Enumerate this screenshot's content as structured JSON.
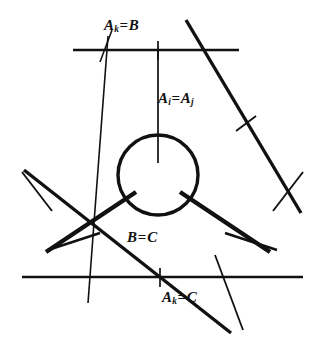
{
  "figure": {
    "name": "reflection-wall-diagram",
    "background_color": "#ffffff",
    "ink_color": "#111111",
    "width": 326,
    "height": 341,
    "labels": {
      "top_wall": {
        "base": "A",
        "sub": "k",
        "relation": "=",
        "rhs": "B",
        "text": "Aₖ=B"
      },
      "vertical_ray": {
        "base": "A",
        "sub": "i",
        "relation": "=",
        "rhs": "A",
        "rhs_sub": "j",
        "text": "Aᵢ=Aⱼ"
      },
      "center_lower": {
        "lhs": "B",
        "relation": "=",
        "rhs": "C",
        "text": "B=C"
      },
      "bottom_wall": {
        "base": "A",
        "sub": "k",
        "relation": "=",
        "rhs": "C",
        "text": "Aₖ=C"
      }
    },
    "geometry": {
      "circle": {
        "cx": 158,
        "cy": 175,
        "r": 42,
        "stroke_width": 3.2
      },
      "radial_rays": [
        {
          "name": "vertical-ray",
          "x1": 158,
          "y1": 52,
          "x2": 158,
          "y2": 162,
          "stroke_width": 1.6
        },
        {
          "name": "lower-left-ray",
          "x1": 48,
          "y1": 253,
          "x2": 133,
          "y2": 196,
          "stroke_width": 4.2
        },
        {
          "name": "lower-right-ray",
          "x1": 268,
          "y1": 253,
          "x2": 183,
          "y2": 196,
          "stroke_width": 4.2
        }
      ],
      "walls": [
        {
          "name": "top-wall",
          "x1": 73,
          "y1": 50,
          "x2": 239,
          "y2": 50,
          "stroke_width": 2.6
        },
        {
          "name": "bottom-wall",
          "x1": 22,
          "y1": 277,
          "x2": 303,
          "y2": 277,
          "stroke_width": 2.6
        },
        {
          "name": "upper-left-thin-diagonal",
          "x1": 107,
          "y1": 37,
          "x2": 90,
          "y2": 302,
          "stroke_width": 1.5
        },
        {
          "name": "upper-right-thick-diagonal",
          "x1": 186,
          "y1": 20,
          "x2": 300,
          "y2": 212,
          "stroke_width": 3.4
        },
        {
          "name": "left-thick-diagonal",
          "x1": 24,
          "y1": 170,
          "x2": 228,
          "y2": 332,
          "stroke_width": 3.4
        },
        {
          "name": "right-thin-diagonal",
          "x1": 230,
          "y1": 290,
          "x2": 234,
          "y2": 310,
          "stroke_width": 1.5
        }
      ],
      "tick_marks": [
        {
          "name": "tick-top-center",
          "x": 158,
          "y": 50
        },
        {
          "name": "tick-bottom-center",
          "x": 160,
          "y": 277
        },
        {
          "name": "tick-upper-right",
          "x": 245,
          "y": 124
        },
        {
          "name": "tick-left-upper",
          "x": 60,
          "y": 188
        },
        {
          "name": "tick-left-lower",
          "x": 103,
          "y": 253
        },
        {
          "name": "tick-right-upper",
          "x": 270,
          "y": 188
        },
        {
          "name": "tick-right-lower",
          "x": 227,
          "y": 248
        }
      ]
    }
  }
}
